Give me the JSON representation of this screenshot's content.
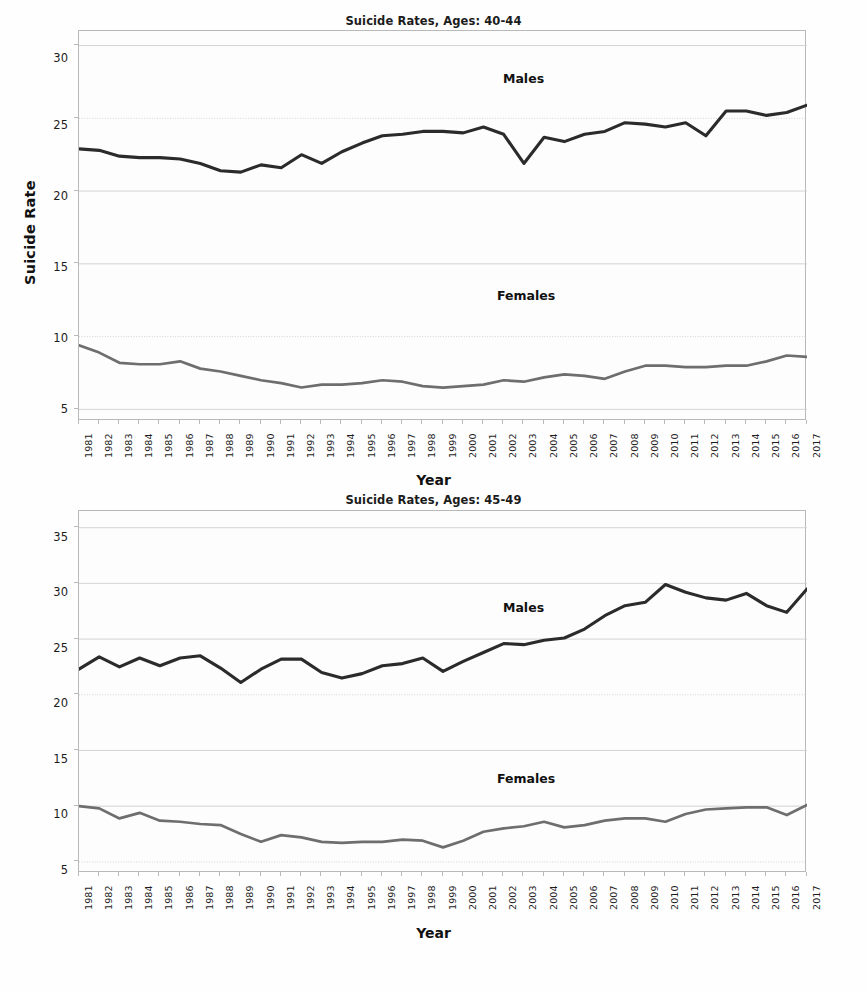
{
  "figure": {
    "background": "#fefefe",
    "panel_count": 2
  },
  "panels": [
    {
      "id": "top",
      "title": "Suicide Rates, Ages: 40-44",
      "xlabel": "Year",
      "ylabel": "Suicide Rate",
      "male_label": "Males",
      "female_label": "Females",
      "yticks": [
        "30",
        "25",
        "20",
        "15",
        "10",
        "5"
      ]
    },
    {
      "id": "bottom",
      "title": "Suicide Rates, Ages: 45-49",
      "xlabel": "Year",
      "ylabel": "Suicide Rate",
      "male_label": "Males",
      "female_label": "Females",
      "yticks": [
        "35",
        "30",
        "25",
        "20",
        "15",
        "10",
        "5"
      ]
    }
  ],
  "chart_data": [
    {
      "type": "line",
      "title": "Suicide Rates, Ages: 40-44",
      "xlabel": "Year",
      "ylabel": "Suicide Rate",
      "xlim": [
        1981,
        2017
      ],
      "ylim": [
        4.2,
        31.0
      ],
      "yticks": [
        5,
        10,
        15,
        20,
        25,
        30
      ],
      "grid": true,
      "legend": "inline-annotations",
      "annotations": [
        {
          "text": "Males",
          "x": 2001,
          "y": 28.0
        },
        {
          "text": "Females",
          "x": 2001,
          "y": 13.0
        }
      ],
      "x": [
        1981,
        1982,
        1983,
        1984,
        1985,
        1986,
        1987,
        1988,
        1989,
        1990,
        1991,
        1992,
        1993,
        1994,
        1995,
        1996,
        1997,
        1998,
        1999,
        2000,
        2001,
        2002,
        2003,
        2004,
        2005,
        2006,
        2007,
        2008,
        2009,
        2010,
        2011,
        2012,
        2013,
        2014,
        2015,
        2016,
        2017
      ],
      "series": [
        {
          "name": "Males",
          "color": "#2b2b2b",
          "values": [
            22.9,
            22.8,
            22.4,
            22.3,
            22.3,
            22.2,
            21.9,
            21.4,
            21.3,
            21.8,
            21.6,
            22.5,
            21.9,
            22.7,
            23.3,
            23.8,
            23.9,
            24.1,
            24.1,
            24.0,
            24.4,
            23.9,
            21.9,
            23.7,
            23.4,
            23.9,
            24.1,
            24.7,
            24.6,
            24.4,
            24.7,
            23.8,
            25.5,
            25.5,
            25.2,
            25.4,
            25.9,
            26.2,
            26.3,
            26.5,
            25.4,
            25.4,
            26.1,
            26.5,
            26.2,
            26.1,
            27.4
          ]
        },
        {
          "name": "Females",
          "color": "#6e6e6e",
          "values": [
            9.4,
            8.9,
            8.2,
            8.1,
            8.1,
            8.3,
            7.8,
            7.6,
            7.3,
            7.0,
            6.8,
            6.5,
            6.7,
            6.7,
            6.8,
            7.0,
            6.9,
            6.6,
            6.5,
            6.6,
            6.7,
            7.0,
            6.9,
            7.2,
            7.4,
            7.3,
            7.1,
            7.6,
            8.0,
            8.0,
            7.9,
            7.9,
            8.0,
            8.0,
            8.3,
            8.7,
            8.6,
            8.6,
            8.8
          ]
        }
      ]
    },
    {
      "type": "line",
      "title": "Suicide Rates, Ages: 45-49",
      "xlabel": "Year",
      "ylabel": "Suicide Rate",
      "xlim": [
        1981,
        2017
      ],
      "ylim": [
        4.0,
        36.5
      ],
      "yticks": [
        5,
        10,
        15,
        20,
        25,
        30,
        35
      ],
      "grid": true,
      "legend": "inline-annotations",
      "annotations": [
        {
          "text": "Males",
          "x": 2002,
          "y": 30.2
        },
        {
          "text": "Females",
          "x": 2001,
          "y": 14.0
        }
      ],
      "x": [
        1981,
        1982,
        1983,
        1984,
        1985,
        1986,
        1987,
        1988,
        1989,
        1990,
        1991,
        1992,
        1993,
        1994,
        1995,
        1996,
        1997,
        1998,
        1999,
        2000,
        2001,
        2002,
        2003,
        2004,
        2005,
        2006,
        2007,
        2008,
        2009,
        2010,
        2011,
        2012,
        2013,
        2014,
        2015,
        2016,
        2017
      ],
      "series": [
        {
          "name": "Males",
          "color": "#2b2b2b",
          "values": [
            22.3,
            23.4,
            22.5,
            23.3,
            22.6,
            23.3,
            23.5,
            22.4,
            21.1,
            22.3,
            23.2,
            23.2,
            22.0,
            21.5,
            21.9,
            22.6,
            22.8,
            23.3,
            22.1,
            23.0,
            23.8,
            24.6,
            24.5,
            24.9,
            25.1,
            25.9,
            27.1,
            28.0,
            28.3,
            29.9,
            29.2,
            28.7,
            28.5,
            29.1,
            28.0,
            27.4,
            29.5
          ]
        },
        {
          "name": "Females",
          "color": "#6e6e6e",
          "values": [
            10.0,
            9.8,
            8.9,
            9.4,
            8.7,
            8.6,
            8.4,
            8.3,
            7.5,
            6.8,
            7.4,
            7.2,
            6.8,
            6.7,
            6.8,
            6.8,
            7.0,
            6.9,
            6.3,
            6.9,
            7.7,
            8.0,
            8.2,
            8.6,
            8.1,
            8.3,
            8.7,
            8.9,
            8.9,
            8.6,
            9.3,
            9.7,
            9.8,
            9.9,
            9.9,
            9.2,
            10.1
          ]
        }
      ]
    }
  ]
}
